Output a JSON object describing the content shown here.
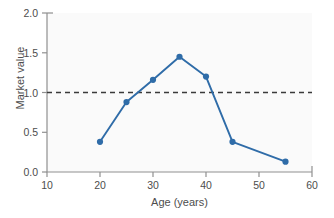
{
  "chart_data": {
    "type": "line",
    "title": "",
    "xlabel": "Age (years)",
    "ylabel": "Market value",
    "xlim": [
      10,
      60
    ],
    "ylim": [
      0.0,
      2.0
    ],
    "xticks": [
      "10",
      "20",
      "30",
      "40",
      "50",
      "60"
    ],
    "xtick_values": [
      10,
      20,
      30,
      40,
      50,
      60
    ],
    "yticks": [
      "0.0",
      "0.5",
      "1.0",
      "1.5",
      "2.0"
    ],
    "ytick_values": [
      0.0,
      0.5,
      1.0,
      1.5,
      2.0
    ],
    "grid": false,
    "legend": null,
    "series": [
      {
        "name": "Market value",
        "color": "#2f6ca8",
        "marker": "circle",
        "x": [
          20,
          25,
          30,
          35,
          40,
          45,
          55
        ],
        "values": [
          0.38,
          0.88,
          1.16,
          1.45,
          1.2,
          0.38,
          0.13
        ]
      }
    ],
    "reference_lines": [
      {
        "name": "unity-reference-line",
        "axis": "y",
        "value": 1.0,
        "style": "dashed",
        "color": "#3a3a3a"
      }
    ],
    "annotations": []
  },
  "figure": {
    "background_color": "#ffffff",
    "plot_background_color": "#fafafa",
    "axis_color": "#808080",
    "tick_color": "#808080",
    "text_color": "#4d4d4d"
  }
}
